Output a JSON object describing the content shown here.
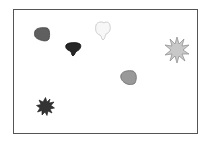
{
  "canvas": {
    "background": "#ffffff",
    "border_color": "#555555"
  },
  "shapes": [
    {
      "id": "blob-1",
      "kind": "blob",
      "fill": "#5f5f5f",
      "stroke": "#444444"
    },
    {
      "id": "blob-2",
      "kind": "blob-drip",
      "fill": "#262626",
      "stroke": "#111111"
    },
    {
      "id": "blob-3",
      "kind": "blob-drip",
      "fill": "#f7f7f7",
      "stroke": "#c8c8c8"
    },
    {
      "id": "star-1",
      "kind": "starburst",
      "fill": "#c8c8c8",
      "stroke": "#8a8a8a"
    },
    {
      "id": "blob-4",
      "kind": "blob",
      "fill": "#999999",
      "stroke": "#6a6a6a"
    },
    {
      "id": "star-2",
      "kind": "starburst",
      "fill": "#333333",
      "stroke": "#1a1a1a"
    }
  ]
}
